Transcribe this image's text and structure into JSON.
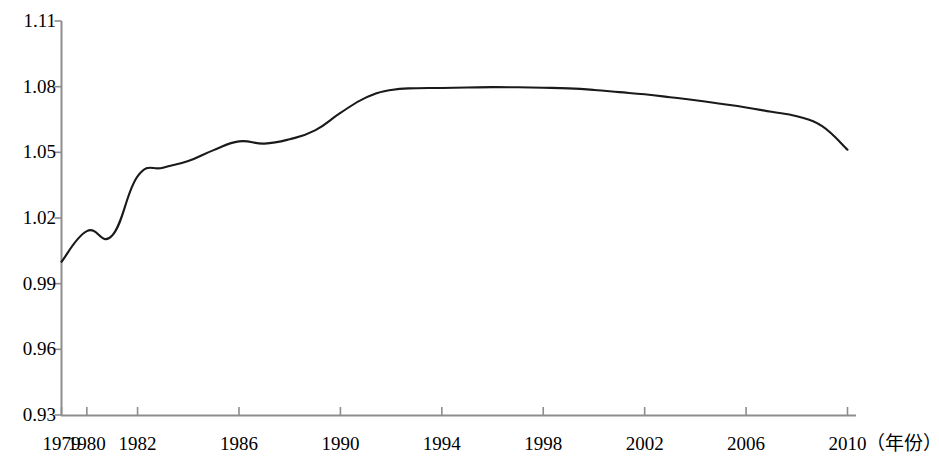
{
  "chart_data": {
    "type": "line",
    "title": "",
    "subtitle": "",
    "xlabel": "（年份）",
    "ylabel": "",
    "grid": false,
    "legend": null,
    "legend_position": "none",
    "line_color": "#1a1a1a",
    "axis_color": "#808080",
    "xlim": [
      1979,
      2010
    ],
    "ylim": [
      0.93,
      1.11
    ],
    "y_ticks": [
      "1.11",
      "1.08",
      "1.05",
      "1.02",
      "0.99",
      "0.96",
      "0.93"
    ],
    "y_tick_values": [
      1.11,
      1.08,
      1.05,
      1.02,
      0.99,
      0.96,
      0.93
    ],
    "x_ticks": [
      "1979",
      "1980",
      "1982",
      "1986",
      "1990",
      "1994",
      "1998",
      "2002",
      "2006",
      "2010"
    ],
    "x_tick_values": [
      1979,
      1980,
      1982,
      1986,
      1990,
      1994,
      1998,
      2002,
      2006,
      2010
    ],
    "x": [
      1979,
      1980,
      1981,
      1982,
      1983,
      1984,
      1985,
      1986,
      1987,
      1988,
      1989,
      1990,
      1991,
      1992,
      1993,
      1994,
      1995,
      1996,
      1997,
      1998,
      1999,
      2000,
      2001,
      2002,
      2003,
      2004,
      2005,
      2006,
      2007,
      2008,
      2009,
      2010
    ],
    "values": [
      1.0,
      1.014,
      1.012,
      1.039,
      1.043,
      1.046,
      1.051,
      1.055,
      1.054,
      1.056,
      1.06,
      1.068,
      1.075,
      1.0785,
      1.0793,
      1.0794,
      1.0796,
      1.0798,
      1.0797,
      1.0795,
      1.0792,
      1.0785,
      1.0775,
      1.0765,
      1.0752,
      1.0738,
      1.0722,
      1.0705,
      1.0685,
      1.0665,
      1.062,
      1.0512
    ],
    "series": [
      {
        "name": "",
        "values": [
          1.0,
          1.014,
          1.012,
          1.039,
          1.043,
          1.046,
          1.051,
          1.055,
          1.054,
          1.056,
          1.06,
          1.068,
          1.075,
          1.0785,
          1.0793,
          1.0794,
          1.0796,
          1.0798,
          1.0797,
          1.0795,
          1.0792,
          1.0785,
          1.0775,
          1.0765,
          1.0752,
          1.0738,
          1.0722,
          1.0705,
          1.0685,
          1.0665,
          1.062,
          1.0512
        ]
      }
    ]
  }
}
